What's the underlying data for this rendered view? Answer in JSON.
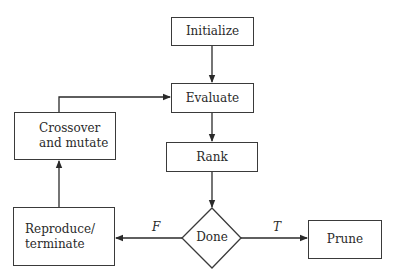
{
  "diagram": {
    "type": "flowchart",
    "nodes": {
      "initialize": {
        "label": "Initialize",
        "shape": "rect"
      },
      "evaluate": {
        "label": "Evaluate",
        "shape": "rect"
      },
      "rank": {
        "label": "Rank",
        "shape": "rect"
      },
      "done": {
        "label": "Done",
        "shape": "diamond"
      },
      "prune": {
        "label": "Prune",
        "shape": "rect"
      },
      "reproduce": {
        "label_line1": "Reproduce/",
        "label_line2": "terminate",
        "shape": "rect"
      },
      "crossover": {
        "label_line1": "Crossover",
        "label_line2": "and mutate",
        "shape": "rect"
      }
    },
    "edges": [
      {
        "from": "Initialize",
        "to": "Evaluate",
        "label": ""
      },
      {
        "from": "Evaluate",
        "to": "Rank",
        "label": ""
      },
      {
        "from": "Rank",
        "to": "Done",
        "label": ""
      },
      {
        "from": "Done",
        "to": "Prune",
        "label": "T"
      },
      {
        "from": "Done",
        "to": "Reproduce/terminate",
        "label": "F"
      },
      {
        "from": "Reproduce/terminate",
        "to": "Crossover and mutate",
        "label": ""
      },
      {
        "from": "Crossover and mutate",
        "to": "Evaluate",
        "label": ""
      }
    ],
    "edge_labels": {
      "true_label": "T",
      "false_label": "F"
    },
    "colors": {
      "stroke": "#3a3a3a",
      "background": "#ffffff",
      "text": "#2a2a2a"
    }
  }
}
